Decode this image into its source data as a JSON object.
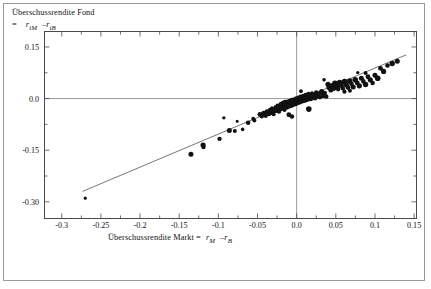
{
  "figure": {
    "background": "#ffffff",
    "frame_color": "#4a4a4a",
    "outer_border_color": "#9a9a9a"
  },
  "labels": {
    "y_axis_line1": "Überschussrendite Fond",
    "y_axis_eq": "=",
    "y_axis_r1": "r",
    "y_axis_r1_sub": "iM",
    "y_axis_minus": "–",
    "y_axis_r2": "r",
    "y_axis_r2_sub": "iB",
    "x_axis_line1": "Überschussrendite Markt  =",
    "x_axis_r1": "r",
    "x_axis_r1_sub": "M",
    "x_axis_minus": "–",
    "x_axis_r2": "r",
    "x_axis_r2_sub": "B"
  },
  "chart_data": {
    "type": "scatter",
    "title": "",
    "xlabel": "Überschussrendite Markt = rM – rB",
    "ylabel": "Überschussrendite Fond = riM – riB",
    "xlim": [
      -0.3214,
      0.1524
    ],
    "ylim": [
      -0.347,
      0.1935
    ],
    "grid": false,
    "legend": null,
    "xticks": [
      -0.3,
      -0.25,
      -0.2,
      -0.15,
      -0.1,
      -0.05,
      0.0,
      0.05,
      0.1,
      0.15
    ],
    "xticklabels": [
      "-0.3",
      "-0.25",
      "-0.2",
      "-0.15",
      "-0.1",
      "-0.05",
      "0.0",
      "0.05",
      "0.1",
      "0.15"
    ],
    "yticks": [
      0.15,
      0.0,
      -0.15,
      -0.3
    ],
    "yticklabels": [
      "0.15",
      "0.0",
      "-0.15",
      "-0.30"
    ],
    "minor_xticks": [
      -0.275,
      -0.225,
      -0.175,
      -0.125,
      -0.075,
      -0.025,
      0.025,
      0.075,
      0.125
    ],
    "minor_yticks": [
      0.075,
      -0.075,
      -0.225
    ],
    "zero_lines": {
      "x": 0.0,
      "y": 0.0,
      "color": "#8d8d8d"
    },
    "regression_line": {
      "color": "#6e6e6e",
      "x_start": -0.2733,
      "y_start": -0.2695,
      "x_end": 0.1398,
      "y_end": 0.127,
      "slope": 0.9598,
      "intercept": -0.0072
    },
    "marker_color": "#111111",
    "points": [
      {
        "x": -0.27,
        "y": -0.2895,
        "r": 1.6
      },
      {
        "x": -0.135,
        "y": -0.162,
        "r": 2.5
      },
      {
        "x": -0.1195,
        "y": -0.135,
        "r": 2.6
      },
      {
        "x": -0.119,
        "y": -0.141,
        "r": 2.2
      },
      {
        "x": -0.0985,
        "y": -0.117,
        "r": 2.2
      },
      {
        "x": -0.086,
        "y": -0.093,
        "r": 2.5
      },
      {
        "x": -0.079,
        "y": -0.0945,
        "r": 2.0
      },
      {
        "x": -0.076,
        "y": -0.066,
        "r": 1.5
      },
      {
        "x": -0.062,
        "y": -0.07,
        "r": 2.3
      },
      {
        "x": -0.0555,
        "y": -0.0585,
        "r": 1.9
      },
      {
        "x": -0.054,
        "y": -0.064,
        "r": 2.0
      },
      {
        "x": -0.047,
        "y": -0.046,
        "r": 2.4
      },
      {
        "x": -0.0445,
        "y": -0.052,
        "r": 2.1
      },
      {
        "x": -0.042,
        "y": -0.043,
        "r": 2.6
      },
      {
        "x": -0.0395,
        "y": -0.0505,
        "r": 2.0
      },
      {
        "x": -0.038,
        "y": -0.0375,
        "r": 2.3
      },
      {
        "x": -0.0355,
        "y": -0.044,
        "r": 2.5
      },
      {
        "x": -0.034,
        "y": -0.033,
        "r": 2.2
      },
      {
        "x": -0.033,
        "y": -0.04,
        "r": 2.7
      },
      {
        "x": -0.0315,
        "y": -0.028,
        "r": 2.0
      },
      {
        "x": -0.03,
        "y": -0.036,
        "r": 2.6
      },
      {
        "x": -0.0295,
        "y": -0.0455,
        "r": 2.1
      },
      {
        "x": -0.028,
        "y": -0.0305,
        "r": 2.5
      },
      {
        "x": -0.0265,
        "y": -0.025,
        "r": 2.3
      },
      {
        "x": -0.0255,
        "y": -0.034,
        "r": 2.8
      },
      {
        "x": -0.0245,
        "y": -0.02,
        "r": 2.0
      },
      {
        "x": -0.0235,
        "y": -0.0295,
        "r": 2.6
      },
      {
        "x": -0.0225,
        "y": -0.0375,
        "r": 2.2
      },
      {
        "x": -0.0215,
        "y": -0.0235,
        "r": 2.7
      },
      {
        "x": -0.0205,
        "y": -0.016,
        "r": 2.1
      },
      {
        "x": -0.0195,
        "y": -0.029,
        "r": 2.5
      },
      {
        "x": -0.0185,
        "y": -0.0205,
        "r": 2.9
      },
      {
        "x": -0.0178,
        "y": -0.013,
        "r": 2.3
      },
      {
        "x": -0.017,
        "y": -0.0265,
        "r": 2.6
      },
      {
        "x": -0.0162,
        "y": -0.0185,
        "r": 2.2
      },
      {
        "x": -0.0155,
        "y": -0.033,
        "r": 2.0
      },
      {
        "x": -0.0148,
        "y": -0.0105,
        "r": 2.4
      },
      {
        "x": -0.014,
        "y": -0.0225,
        "r": 2.8
      },
      {
        "x": -0.0133,
        "y": -0.0155,
        "r": 2.5
      },
      {
        "x": -0.0126,
        "y": -0.026,
        "r": 2.2
      },
      {
        "x": -0.0119,
        "y": -0.0085,
        "r": 2.1
      },
      {
        "x": -0.0112,
        "y": -0.0195,
        "r": 2.7
      },
      {
        "x": -0.0105,
        "y": -0.0135,
        "r": 2.4
      },
      {
        "x": -0.0098,
        "y": -0.023,
        "r": 2.2
      },
      {
        "x": -0.0091,
        "y": -0.006,
        "r": 2.0
      },
      {
        "x": -0.0084,
        "y": -0.017,
        "r": 2.6
      },
      {
        "x": -0.0077,
        "y": -0.011,
        "r": 2.9
      },
      {
        "x": -0.007,
        "y": -0.0205,
        "r": 2.3
      },
      {
        "x": -0.0063,
        "y": -0.004,
        "r": 2.1
      },
      {
        "x": -0.0056,
        "y": -0.0145,
        "r": 2.7
      },
      {
        "x": -0.0049,
        "y": -0.009,
        "r": 2.5
      },
      {
        "x": -0.0042,
        "y": -0.018,
        "r": 2.2
      },
      {
        "x": -0.0035,
        "y": -0.002,
        "r": 2.0
      },
      {
        "x": -0.0028,
        "y": -0.012,
        "r": 2.8
      },
      {
        "x": -0.0021,
        "y": -0.0065,
        "r": 2.4
      },
      {
        "x": -0.0014,
        "y": -0.0155,
        "r": 2.3
      },
      {
        "x": -0.0007,
        "y": 0.0005,
        "r": 2.1
      },
      {
        "x": 0.0,
        "y": -0.0098,
        "r": 2.6
      },
      {
        "x": 0.0007,
        "y": -0.0042,
        "r": 2.5
      },
      {
        "x": 0.0014,
        "y": -0.013,
        "r": 2.2
      },
      {
        "x": 0.0021,
        "y": 0.003,
        "r": 2.0
      },
      {
        "x": 0.0028,
        "y": -0.0075,
        "r": 2.7
      },
      {
        "x": 0.0035,
        "y": -0.0018,
        "r": 2.4
      },
      {
        "x": 0.0042,
        "y": -0.0105,
        "r": 2.3
      },
      {
        "x": 0.005,
        "y": 0.0055,
        "r": 2.1
      },
      {
        "x": 0.0058,
        "y": -0.005,
        "r": 2.6
      },
      {
        "x": 0.0066,
        "y": 0.0008,
        "r": 2.5
      },
      {
        "x": 0.0074,
        "y": -0.008,
        "r": 2.2
      },
      {
        "x": 0.0082,
        "y": 0.008,
        "r": 2.0
      },
      {
        "x": 0.009,
        "y": -0.0025,
        "r": 2.7
      },
      {
        "x": 0.0098,
        "y": 0.0035,
        "r": 2.4
      },
      {
        "x": 0.0106,
        "y": -0.0058,
        "r": 2.3
      },
      {
        "x": 0.0115,
        "y": 0.0105,
        "r": 2.2
      },
      {
        "x": 0.0124,
        "y": 0.0,
        "r": 2.6
      },
      {
        "x": 0.0133,
        "y": 0.0062,
        "r": 2.5
      },
      {
        "x": 0.0142,
        "y": -0.0035,
        "r": 2.1
      },
      {
        "x": 0.0152,
        "y": 0.013,
        "r": 2.3
      },
      {
        "x": 0.0162,
        "y": 0.0025,
        "r": 2.7
      },
      {
        "x": 0.0172,
        "y": 0.0088,
        "r": 2.4
      },
      {
        "x": 0.0182,
        "y": -0.0012,
        "r": 2.2
      },
      {
        "x": 0.0195,
        "y": 0.0155,
        "r": 2.0
      },
      {
        "x": 0.0208,
        "y": 0.005,
        "r": 2.6
      },
      {
        "x": 0.0221,
        "y": 0.0112,
        "r": 2.5
      },
      {
        "x": 0.0234,
        "y": 0.0012,
        "r": 2.3
      },
      {
        "x": 0.025,
        "y": 0.018,
        "r": 2.2
      },
      {
        "x": 0.0266,
        "y": 0.0075,
        "r": 2.7
      },
      {
        "x": 0.0282,
        "y": 0.0138,
        "r": 2.4
      },
      {
        "x": 0.0298,
        "y": 0.0038,
        "r": 2.1
      },
      {
        "x": 0.0318,
        "y": 0.0205,
        "r": 2.5
      },
      {
        "x": 0.0338,
        "y": 0.01,
        "r": 2.8
      },
      {
        "x": 0.0358,
        "y": 0.0162,
        "r": 2.3
      },
      {
        "x": 0.0378,
        "y": 0.0062,
        "r": 2.2
      },
      {
        "x": 0.04,
        "y": 0.0415,
        "r": 2.6
      },
      {
        "x": 0.0418,
        "y": 0.033,
        "r": 2.9
      },
      {
        "x": 0.0436,
        "y": 0.025,
        "r": 2.5
      },
      {
        "x": 0.0454,
        "y": 0.0385,
        "r": 2.4
      },
      {
        "x": 0.0472,
        "y": 0.03,
        "r": 2.7
      },
      {
        "x": 0.049,
        "y": 0.044,
        "r": 3.0
      },
      {
        "x": 0.051,
        "y": 0.0355,
        "r": 2.6
      },
      {
        "x": 0.053,
        "y": 0.0275,
        "r": 2.3
      },
      {
        "x": 0.055,
        "y": 0.0465,
        "r": 2.8
      },
      {
        "x": 0.057,
        "y": 0.038,
        "r": 2.5
      },
      {
        "x": 0.059,
        "y": 0.03,
        "r": 2.2
      },
      {
        "x": 0.0612,
        "y": 0.049,
        "r": 2.9
      },
      {
        "x": 0.0634,
        "y": 0.0405,
        "r": 2.6
      },
      {
        "x": 0.0656,
        "y": 0.032,
        "r": 2.4
      },
      {
        "x": 0.0678,
        "y": 0.051,
        "r": 2.7
      },
      {
        "x": 0.07,
        "y": 0.0425,
        "r": 2.3
      },
      {
        "x": 0.0722,
        "y": 0.034,
        "r": 2.5
      },
      {
        "x": 0.0748,
        "y": 0.0545,
        "r": 2.8
      },
      {
        "x": 0.0774,
        "y": 0.0455,
        "r": 2.4
      },
      {
        "x": 0.08,
        "y": 0.037,
        "r": 2.6
      },
      {
        "x": 0.0826,
        "y": 0.059,
        "r": 2.5
      },
      {
        "x": 0.0852,
        "y": 0.05,
        "r": 2.3
      },
      {
        "x": 0.088,
        "y": 0.041,
        "r": 2.7
      },
      {
        "x": 0.091,
        "y": 0.0635,
        "r": 2.4
      },
      {
        "x": 0.094,
        "y": 0.0545,
        "r": 2.6
      },
      {
        "x": 0.097,
        "y": 0.0455,
        "r": 2.2
      },
      {
        "x": 0.1,
        "y": 0.068,
        "r": 2.5
      },
      {
        "x": 0.1035,
        "y": 0.059,
        "r": 2.8
      },
      {
        "x": 0.107,
        "y": 0.088,
        "r": 2.4
      },
      {
        "x": 0.111,
        "y": 0.079,
        "r": 2.6
      },
      {
        "x": 0.116,
        "y": 0.096,
        "r": 2.3
      },
      {
        "x": 0.122,
        "y": 0.102,
        "r": 2.7
      },
      {
        "x": 0.1285,
        "y": 0.1085,
        "r": 2.5
      },
      {
        "x": -0.01,
        "y": -0.047,
        "r": 2.4
      },
      {
        "x": -0.006,
        "y": -0.052,
        "r": 2.2
      },
      {
        "x": 0.0055,
        "y": 0.0215,
        "r": 1.9
      },
      {
        "x": 0.0155,
        "y": -0.0305,
        "r": 2.8
      },
      {
        "x": 0.035,
        "y": 0.0545,
        "r": 1.8
      },
      {
        "x": 0.061,
        "y": 0.02,
        "r": 2.1
      },
      {
        "x": 0.068,
        "y": 0.023,
        "r": 2.0
      },
      {
        "x": 0.078,
        "y": 0.0755,
        "r": 1.7
      },
      {
        "x": 0.088,
        "y": 0.0745,
        "r": 2.0
      },
      {
        "x": -0.093,
        "y": -0.056,
        "r": 1.7
      },
      {
        "x": -0.069,
        "y": -0.0895,
        "r": 1.8
      }
    ]
  }
}
